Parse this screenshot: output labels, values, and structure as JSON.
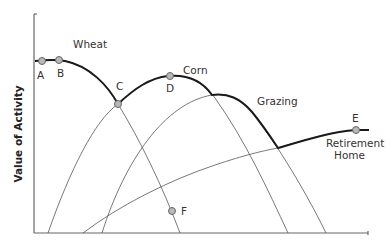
{
  "diagram": {
    "y_axis_label": "Value of Activity",
    "x_axis_label": "",
    "curves": [
      {
        "name": "Wheat",
        "label": "Wheat"
      },
      {
        "name": "Corn",
        "label": "Corn"
      },
      {
        "name": "Grazing",
        "label": "Grazing"
      },
      {
        "name": "Retirement Home",
        "label_line1": "Retirement",
        "label_line2": "Home"
      }
    ],
    "points": [
      {
        "id": "A",
        "label": "A"
      },
      {
        "id": "B",
        "label": "B"
      },
      {
        "id": "C",
        "label": "C"
      },
      {
        "id": "D",
        "label": "D"
      },
      {
        "id": "E",
        "label": "E"
      },
      {
        "id": "F",
        "label": "F"
      }
    ],
    "colors": {
      "envelope": "#1a1a1a",
      "curve": "#555555",
      "point_fill": "#b8b8b8",
      "axis": "#666666"
    }
  }
}
